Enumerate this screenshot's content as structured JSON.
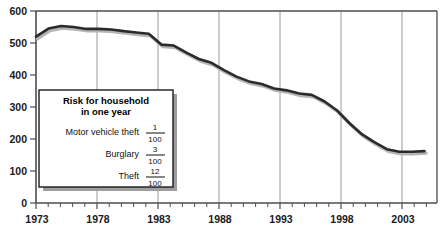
{
  "chart_data": {
    "type": "line",
    "title": "",
    "xlabel": "",
    "ylabel": "",
    "xlim": [
      1973,
      2005
    ],
    "ylim": [
      0,
      600
    ],
    "grid": "vertical-only",
    "legend_position": "inside-lower-left",
    "x_tick_labels": [
      "1973",
      "1978",
      "1983",
      "1988",
      "1993",
      "1998",
      "2003"
    ],
    "y_tick_labels": [
      "0",
      "100",
      "200",
      "300",
      "400",
      "500",
      "600"
    ],
    "x": [
      1973,
      1974,
      1975,
      1976,
      1977,
      1978,
      1979,
      1980,
      1981,
      1982,
      1983,
      1984,
      1985,
      1986,
      1987,
      1988,
      1989,
      1990,
      1991,
      1992,
      1993,
      1994,
      1995,
      1996,
      1997,
      1998,
      1999,
      2000,
      2001,
      2002,
      2003,
      2004
    ],
    "series": [
      {
        "name": "Property crime victimization rate",
        "values": [
          520,
          545,
          553,
          550,
          544,
          544,
          542,
          537,
          533,
          529,
          495,
          492,
          470,
          450,
          438,
          415,
          395,
          380,
          372,
          358,
          352,
          342,
          338,
          318,
          290,
          250,
          215,
          190,
          168,
          160,
          160,
          162
        ]
      }
    ]
  },
  "axes": {
    "y_ticks": [
      {
        "label": "600",
        "value": 600
      },
      {
        "label": "500",
        "value": 500
      },
      {
        "label": "400",
        "value": 400
      },
      {
        "label": "300",
        "value": 300
      },
      {
        "label": "200",
        "value": 200
      },
      {
        "label": "100",
        "value": 100
      },
      {
        "label": "0",
        "value": 0
      }
    ],
    "x_ticks": [
      {
        "label": "1973",
        "value": 1973
      },
      {
        "label": "1978",
        "value": 1978
      },
      {
        "label": "1983",
        "value": 1983
      },
      {
        "label": "1988",
        "value": 1988
      },
      {
        "label": "1993",
        "value": 1993
      },
      {
        "label": "1998",
        "value": 1998
      },
      {
        "label": "2003",
        "value": 2003
      }
    ]
  },
  "legend": {
    "title_line1": "Risk for household",
    "title_line2": "in one year",
    "rows": [
      {
        "label": "Motor vehicle theft",
        "numerator": "1",
        "denominator": "100"
      },
      {
        "label": "Burglary",
        "numerator": "3",
        "denominator": "100"
      },
      {
        "label": "Theft",
        "numerator": "12",
        "denominator": "100"
      }
    ]
  },
  "colors": {
    "line": "#2b2b2b",
    "grid": "#9a9a9a",
    "axis": "#4d4d4d",
    "legend_border": "#1a1a1a",
    "legend_shadow": "#9e9e9e",
    "text": "#1a1a1a",
    "background": "#ffffff"
  },
  "caption": {
    "text": ""
  }
}
